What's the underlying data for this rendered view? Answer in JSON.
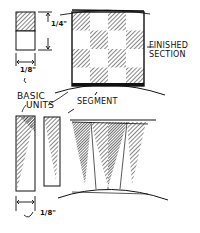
{
  "diagram": {
    "labels": {
      "finished_section_line1": "FINISHED",
      "finished_section_line2": "SECTION",
      "basic_units_line1": "BASIC",
      "basic_units_line2": "UNITS",
      "segment": "SEGMENT"
    },
    "dimensions": {
      "height": "1/4\"",
      "width_top": "1/8\"",
      "width_bottom": "1/8\""
    },
    "checkerboard": {
      "rows": 4,
      "cols": 4,
      "first_cell_hatched": true
    },
    "colors": {
      "ink": "#111111",
      "background": "#ffffff"
    }
  }
}
